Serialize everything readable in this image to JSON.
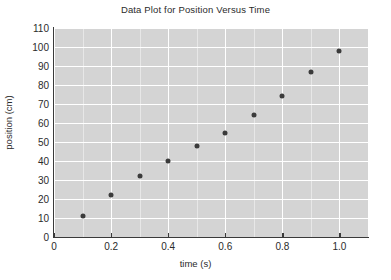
{
  "chart_data": {
    "type": "scatter",
    "title": "Data Plot for Position Versus Time",
    "xlabel": "time (s)",
    "ylabel": "position (cm)",
    "xlim": [
      0,
      1.1
    ],
    "ylim": [
      0,
      110
    ],
    "grid": true,
    "legend": "none",
    "x_ticks": [
      "0",
      "0.2",
      "0.4",
      "0.6",
      "0.8",
      "1.0"
    ],
    "x_tick_values": [
      0,
      0.2,
      0.4,
      0.6,
      0.8,
      1.0
    ],
    "x_minor_step": 0.1,
    "y_ticks": [
      "0",
      "10",
      "20",
      "30",
      "40",
      "50",
      "60",
      "70",
      "80",
      "90",
      "100",
      "110"
    ],
    "y_tick_values": [
      0,
      10,
      20,
      30,
      40,
      50,
      60,
      70,
      80,
      90,
      100,
      110
    ],
    "marker": "circle",
    "marker_color": "#3b3b3b",
    "plot_background": "#d4d4d4",
    "gridline_color": "#ffffff",
    "x": [
      0.1,
      0.2,
      0.3,
      0.4,
      0.5,
      0.6,
      0.7,
      0.8,
      0.9,
      1.0
    ],
    "values": [
      11,
      22,
      32,
      40,
      48,
      55,
      64,
      74,
      87,
      98
    ],
    "points": [
      {
        "x": 0.1,
        "y": 11
      },
      {
        "x": 0.2,
        "y": 22
      },
      {
        "x": 0.3,
        "y": 32
      },
      {
        "x": 0.4,
        "y": 40
      },
      {
        "x": 0.5,
        "y": 48
      },
      {
        "x": 0.6,
        "y": 55
      },
      {
        "x": 0.7,
        "y": 64
      },
      {
        "x": 0.8,
        "y": 74
      },
      {
        "x": 0.9,
        "y": 87
      },
      {
        "x": 1.0,
        "y": 98
      }
    ]
  }
}
